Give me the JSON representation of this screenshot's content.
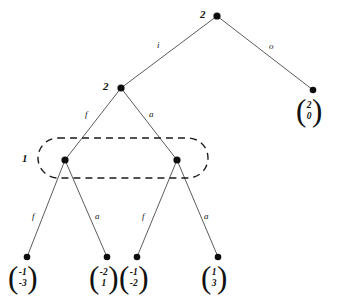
{
  "diagram": {
    "type": "tree",
    "colors": {
      "node": "#0d0d0d",
      "edge": "#4a4a4a",
      "group_outline": "#1a1a1a",
      "background": "#ffffff",
      "text": "#111111"
    },
    "nodes": [
      {
        "id": "root",
        "label": "2",
        "x": 217,
        "y": 16,
        "label_x": 200,
        "label_y": 9
      },
      {
        "id": "n2",
        "label": "2",
        "x": 121,
        "y": 88,
        "label_x": 103,
        "label_y": 81
      },
      {
        "id": "n3",
        "label": "",
        "x": 313,
        "y": 90
      },
      {
        "id": "n4",
        "label": "",
        "x": 65,
        "y": 160
      },
      {
        "id": "n5",
        "label": "",
        "x": 177,
        "y": 160
      },
      {
        "id": "leaf1",
        "label": "",
        "x": 27,
        "y": 257
      },
      {
        "id": "leaf2",
        "label": "",
        "x": 107,
        "y": 257
      },
      {
        "id": "leaf3",
        "label": "",
        "x": 137,
        "y": 257
      },
      {
        "id": "leaf4",
        "label": "",
        "x": 218,
        "y": 257
      }
    ],
    "edges": [
      {
        "from": "root",
        "to": "n2",
        "label": "i",
        "label_x": 157,
        "label_y": 41
      },
      {
        "from": "root",
        "to": "n3",
        "label": "o",
        "label_x": 269,
        "label_y": 42
      },
      {
        "from": "n2",
        "to": "n4",
        "label": "f",
        "label_x": 85,
        "label_y": 110
      },
      {
        "from": "n2",
        "to": "n5",
        "label": "a",
        "label_x": 149,
        "label_y": 110
      },
      {
        "from": "n4",
        "to": "leaf1",
        "label": "f",
        "label_x": 32,
        "label_y": 212
      },
      {
        "from": "n4",
        "to": "leaf2",
        "label": "a",
        "label_x": 95,
        "label_y": 212
      },
      {
        "from": "n5",
        "to": "leaf3",
        "label": "f",
        "label_x": 142,
        "label_y": 212
      },
      {
        "from": "n5",
        "to": "leaf4",
        "label": "a",
        "label_x": 204,
        "label_y": 212
      }
    ],
    "group": {
      "label": "1",
      "label_x": 22,
      "label_y": 153,
      "x": 38,
      "y": 138,
      "width": 170,
      "height": 40,
      "radius": 20,
      "style": "dashed"
    },
    "vectors": [
      {
        "id": "vec-root-right",
        "top": "2",
        "bottom": "0",
        "x": 296,
        "y": 99
      },
      {
        "id": "vec-leaf1",
        "top": "-1",
        "bottom": "-3",
        "x": 8,
        "y": 266
      },
      {
        "id": "vec-leaf2",
        "top": "-2",
        "bottom": "1",
        "x": 89,
        "y": 266
      },
      {
        "id": "vec-leaf3",
        "top": "-1",
        "bottom": "-2",
        "x": 119,
        "y": 266
      },
      {
        "id": "vec-leaf4",
        "top": "1",
        "bottom": "3",
        "x": 201,
        "y": 266
      }
    ]
  }
}
